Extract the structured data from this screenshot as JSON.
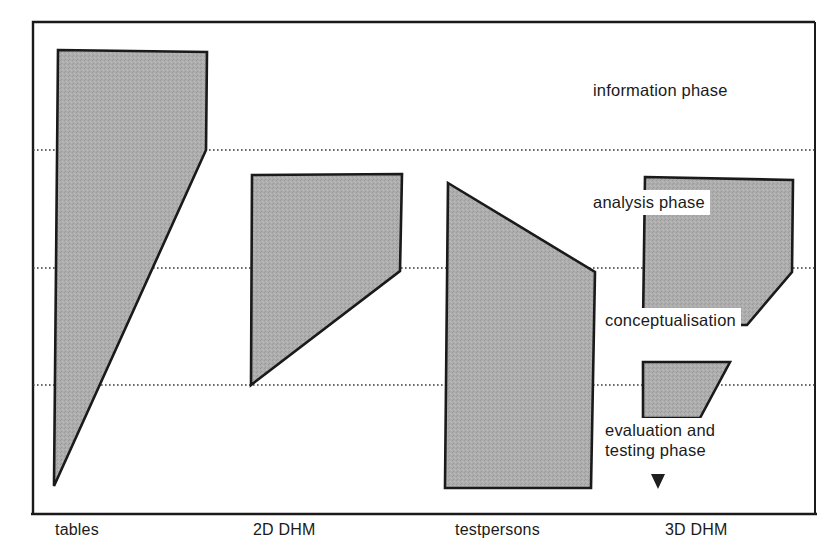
{
  "figure": {
    "type": "diagram",
    "frame": {
      "x": 33,
      "y": 22,
      "width": 782,
      "height": 492
    },
    "colors": {
      "shape_fill": "#a9a9a9",
      "shape_stroke": "#1a1a1a",
      "frame_stroke": "#1a1a1a",
      "divider_line": "#3a3a3a",
      "text": "#1a1a1a",
      "label_background": "#ffffff"
    }
  },
  "phase_labels": [
    {
      "text": "information phase",
      "x": 588,
      "y": 78,
      "lines": 1
    },
    {
      "text": "analysis phase",
      "x": 588,
      "y": 190,
      "lines": 1
    },
    {
      "text": "conceptualisation",
      "x": 600,
      "y": 308,
      "lines": 1
    },
    {
      "text": "evaluation and\ntesting phase",
      "x": 600,
      "y": 418,
      "lines": 2
    }
  ],
  "axis_labels": [
    {
      "text": "tables",
      "x": 55,
      "y": 521
    },
    {
      "text": "2D DHM",
      "x": 253,
      "y": 521
    },
    {
      "text": "testpersons",
      "x": 455,
      "y": 521
    },
    {
      "text": "3D DHM",
      "x": 665,
      "y": 521
    }
  ],
  "divider_lines": [
    {
      "name": "information-analysis-divider",
      "y": 150,
      "x1": 33,
      "x2": 815
    },
    {
      "name": "analysis-conceptualisation-divider",
      "y": 268,
      "x1": 33,
      "x2": 815
    },
    {
      "name": "conceptualisation-evaluation-divider",
      "y": 385,
      "x1": 33,
      "x2": 815
    }
  ],
  "shapes": [
    {
      "name": "tables-wedge",
      "points": "58,50 207,52 206,150 54,486",
      "category": "tables"
    },
    {
      "name": "2d-dhm-wedge",
      "points": "252,175 402,174 400,271 251,385",
      "category": "2D DHM"
    },
    {
      "name": "testpersons-wedge",
      "points": "448,183 595,272 591,488 445,488",
      "category": "testpersons"
    },
    {
      "name": "3d-dhm-wedge-upper",
      "points": "645,177 793,180 792,272 747,325 643,325",
      "category": "3D DHM"
    },
    {
      "name": "3d-dhm-wedge-lower",
      "points": "643,362 730,362 700,418 643,418",
      "category": "3D DHM"
    }
  ],
  "marker": {
    "name": "pointer-marker",
    "x": 658,
    "y": 480
  }
}
